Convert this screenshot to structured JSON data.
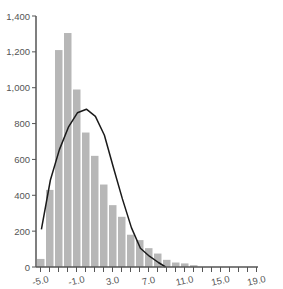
{
  "chart_data": {
    "type": "bar",
    "title": "",
    "xlabel": "",
    "ylabel": "",
    "ylim": [
      0,
      1400
    ],
    "xlim": [
      -5.0,
      19.0
    ],
    "grid": false,
    "legend": null,
    "y_ticks": [
      0,
      200,
      400,
      600,
      800,
      1000,
      1200,
      1400
    ],
    "y_tick_labels": [
      "0",
      "200",
      "400",
      "600",
      "800",
      "1,000",
      "1,200",
      "1,400"
    ],
    "x_ticks": [
      -5.0,
      -1.0,
      3.0,
      7.0,
      11.0,
      15.0,
      19.0
    ],
    "x_tick_labels": [
      "-5.0",
      "-1.0",
      "3.0",
      "7.0",
      "11.0",
      "15.0",
      "19.0"
    ],
    "bin_width": 1.0,
    "categories": [
      -5,
      -4,
      -3,
      -2,
      -1,
      0,
      1,
      2,
      3,
      4,
      5,
      6,
      7,
      8,
      9,
      10,
      11,
      12
    ],
    "series": [
      {
        "name": "histogram",
        "type": "bar",
        "color": "#b7b7b7",
        "values": [
          45,
          430,
          1210,
          1305,
          990,
          750,
          620,
          460,
          345,
          280,
          180,
          150,
          105,
          75,
          40,
          25,
          20,
          10
        ]
      },
      {
        "name": "density curve",
        "type": "line",
        "color": "#1a1a1a",
        "x": [
          -4.9,
          -3.9,
          -2.9,
          -1.9,
          -0.9,
          0.1,
          1.1,
          2.1,
          3.1,
          4.1,
          5.1,
          6.1,
          7.1,
          8.1,
          8.9
        ],
        "values": [
          210,
          485,
          655,
          780,
          860,
          880,
          840,
          735,
          555,
          380,
          220,
          105,
          60,
          25,
          0
        ]
      }
    ]
  }
}
